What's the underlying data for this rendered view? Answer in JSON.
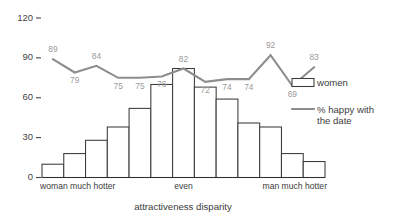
{
  "chart_data": {
    "type": "bar",
    "title": "",
    "xlabel": "attractiveness disparity",
    "ylabel": "",
    "ylim": [
      0,
      120
    ],
    "grid": false,
    "y_ticks": [
      0,
      30,
      60,
      90,
      120
    ],
    "y_tick_labels": [
      "0",
      "30",
      "60",
      "90",
      "120"
    ],
    "categories": [
      "1",
      "2",
      "3",
      "4",
      "5",
      "6",
      "7",
      "8",
      "9",
      "10",
      "11",
      "12",
      "13"
    ],
    "x_category_labels": {
      "left": "woman much hotter",
      "center": "even",
      "right": "man much hotter"
    },
    "legend": {
      "position": "right",
      "entries": [
        {
          "name": "women",
          "marker": "bar-swatch"
        },
        {
          "name": "% happy with the date",
          "marker": "line-swatch"
        }
      ]
    },
    "series": [
      {
        "name": "women",
        "type": "bar",
        "values": [
          10,
          18,
          28,
          38,
          52,
          70,
          82,
          68,
          59,
          41,
          38,
          18,
          12
        ]
      },
      {
        "name": "% happy with the date",
        "type": "line",
        "values": [
          89,
          79,
          84,
          75,
          75,
          76,
          82,
          72,
          74,
          74,
          92,
          69,
          83
        ],
        "point_labels": [
          "89",
          "79",
          "84",
          "75",
          "75",
          "76",
          "82",
          "72",
          "74",
          "74",
          "92",
          "69",
          "83"
        ],
        "label_placement": [
          "above",
          "below",
          "above",
          "below",
          "below",
          "below",
          "above",
          "below",
          "below",
          "below",
          "above",
          "below",
          "above"
        ]
      }
    ]
  },
  "legend_labels": {
    "women": "women",
    "happy_line_1": "% happy with",
    "happy_line_2": "the date"
  },
  "axis": {
    "x_title": "attractiveness disparity",
    "x_left": "woman much hotter",
    "x_center": "even",
    "x_right": "man much hotter"
  },
  "colors": {
    "bar_stroke": "#3a3a3a",
    "bar_fill": "#ffffff",
    "line": "#8d8d8d",
    "point_label": "#9a9a9a",
    "text": "#3c3c3c",
    "axis": "#2e2e2e",
    "background": "#ffffff"
  }
}
